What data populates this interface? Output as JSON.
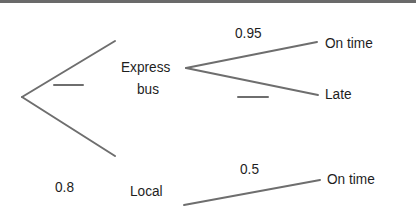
{
  "diagram": {
    "type": "tree diagram",
    "root": {
      "branches": [
        {
          "label": "Express bus",
          "label_lines": [
            "Express",
            "bus"
          ],
          "probability": "",
          "probability_blank": true,
          "branches": [
            {
              "label": "On time",
              "probability": "0.95"
            },
            {
              "label": "Late",
              "probability": "",
              "probability_blank": true
            }
          ]
        },
        {
          "label": "Local",
          "probability": "0.8",
          "branches": [
            {
              "label": "On time",
              "probability": "0.5"
            }
          ]
        }
      ]
    },
    "colors": {
      "line": "#6e6e6e",
      "text": "#1e1e1e",
      "border": "#6a6a6a",
      "background": "#ffffff"
    }
  }
}
